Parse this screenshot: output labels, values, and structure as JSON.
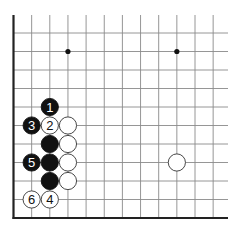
{
  "diagram": {
    "type": "go-board-fragment",
    "corner": "bottom-left",
    "columns_visible": 12,
    "rows_visible": 11,
    "colors": {
      "background": "#ffffff",
      "grid_line": "#8a8a8a",
      "edge_line": "#222222",
      "black_stone": "#111111",
      "white_stone": "#ffffff",
      "stone_outline": "#333333",
      "black_numeral": "#ffffff",
      "white_numeral": "#111111",
      "hoshi": "#111111"
    },
    "hoshi": [
      {
        "col": 3,
        "row": 9
      },
      {
        "col": 9,
        "row": 9
      }
    ],
    "stones": [
      {
        "color": "black",
        "col": 2,
        "row": 6,
        "label": "1"
      },
      {
        "color": "white",
        "col": 2,
        "row": 5,
        "label": "2"
      },
      {
        "color": "black",
        "col": 1,
        "row": 5,
        "label": "3"
      },
      {
        "color": "white",
        "col": 2,
        "row": 1,
        "label": "4"
      },
      {
        "color": "black",
        "col": 1,
        "row": 3,
        "label": "5"
      },
      {
        "color": "white",
        "col": 1,
        "row": 1,
        "label": "6"
      },
      {
        "color": "white",
        "col": 3,
        "row": 5,
        "label": ""
      },
      {
        "color": "black",
        "col": 2,
        "row": 4,
        "label": ""
      },
      {
        "color": "white",
        "col": 3,
        "row": 4,
        "label": ""
      },
      {
        "color": "black",
        "col": 2,
        "row": 3,
        "label": ""
      },
      {
        "color": "white",
        "col": 3,
        "row": 3,
        "label": ""
      },
      {
        "color": "black",
        "col": 2,
        "row": 2,
        "label": ""
      },
      {
        "color": "white",
        "col": 3,
        "row": 2,
        "label": ""
      },
      {
        "color": "white",
        "col": 9,
        "row": 3,
        "label": ""
      }
    ]
  }
}
